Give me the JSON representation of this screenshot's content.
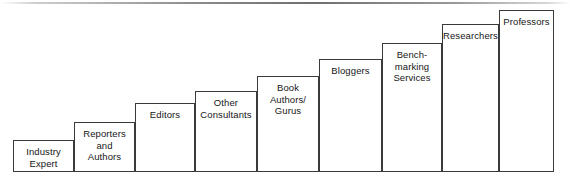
{
  "figure": {
    "name": "expertise-staircase-diagram",
    "type": "ascending-step-chart",
    "top_rule_color": "#6f6f6f",
    "border_color": "#3a3a3a",
    "background_color": "#ffffff",
    "text_color": "#161616",
    "baseline_y": 172,
    "steps": [
      {
        "label": "Industry\nExpert",
        "rank": 1,
        "x": 13,
        "width": 61,
        "top": 140,
        "height": 32
      },
      {
        "label": "Reporters\nand\nAuthors",
        "rank": 2,
        "x": 74,
        "width": 61,
        "top": 122,
        "height": 50
      },
      {
        "label": "Editors",
        "rank": 3,
        "x": 135,
        "width": 60,
        "top": 103,
        "height": 69
      },
      {
        "label": "Other\nConsultants",
        "rank": 4,
        "x": 195,
        "width": 62,
        "top": 91,
        "height": 81
      },
      {
        "label": "Book\nAuthors/\nGurus",
        "rank": 5,
        "x": 257,
        "width": 62,
        "top": 76,
        "height": 96
      },
      {
        "label": "Bloggers",
        "rank": 6,
        "x": 319,
        "width": 63,
        "top": 59,
        "height": 113
      },
      {
        "label": "Bench-\nmarking\nServices",
        "rank": 7,
        "x": 382,
        "width": 60,
        "top": 43,
        "height": 129
      },
      {
        "label": "Researchers",
        "rank": 8,
        "x": 442,
        "width": 57,
        "top": 24,
        "height": 148
      },
      {
        "label": "Professors",
        "rank": 9,
        "x": 499,
        "width": 55,
        "top": 10,
        "height": 162
      }
    ]
  },
  "chart_data": {
    "type": "bar",
    "title": "",
    "subtitle": "",
    "xlabel": "",
    "ylabel": "",
    "grid": false,
    "legend": null,
    "orientation": "vertical",
    "note": "Ascending staircase of source credibility categories; bar heights in pixels above the baseline.",
    "categories": [
      "Industry Expert",
      "Reporters and Authors",
      "Editors",
      "Other Consultants",
      "Book Authors/Gurus",
      "Bloggers",
      "Bench-marking Services",
      "Researchers",
      "Professors"
    ],
    "values": [
      32,
      50,
      69,
      81,
      96,
      113,
      129,
      148,
      162
    ],
    "ylim": [
      0,
      172
    ]
  }
}
